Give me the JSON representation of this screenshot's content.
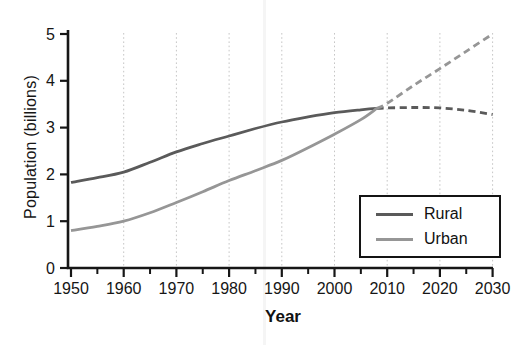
{
  "chart_data": {
    "type": "line",
    "title": "",
    "xlabel": "Year",
    "ylabel": "Population (billions)",
    "xlim": [
      1950,
      2030
    ],
    "ylim": [
      0,
      5
    ],
    "x_major_ticks": [
      1950,
      1960,
      1970,
      1980,
      1990,
      2000,
      2010,
      2020,
      2030
    ],
    "x_minor_tick_step": 5,
    "y_ticks": [
      0,
      1,
      2,
      3,
      4,
      5
    ],
    "grid": {
      "vertical_at": [
        1960,
        1970,
        1980,
        1990,
        2000,
        2010,
        2020,
        2030
      ],
      "style": "dotted",
      "color": "#c6c6c6"
    },
    "projection_start_year": 2008,
    "projection_style": "dashed",
    "x": [
      1950,
      1955,
      1960,
      1965,
      1970,
      1975,
      1980,
      1985,
      1990,
      1995,
      2000,
      2005,
      2008,
      2010,
      2015,
      2020,
      2025,
      2030
    ],
    "series": [
      {
        "name": "Rural",
        "color": "#5a5a5a",
        "values": [
          1.83,
          1.93,
          2.05,
          2.26,
          2.48,
          2.66,
          2.82,
          2.98,
          3.12,
          3.23,
          3.32,
          3.38,
          3.41,
          3.42,
          3.43,
          3.42,
          3.37,
          3.28
        ]
      },
      {
        "name": "Urban",
        "color": "#969696",
        "values": [
          0.8,
          0.89,
          1.0,
          1.18,
          1.4,
          1.63,
          1.87,
          2.08,
          2.3,
          2.57,
          2.86,
          3.17,
          3.41,
          3.52,
          3.9,
          4.26,
          4.63,
          5.0
        ]
      }
    ],
    "legend": {
      "position": "bottom-right",
      "entries": [
        "Rural",
        "Urban"
      ]
    },
    "axis_color": "#161616"
  }
}
